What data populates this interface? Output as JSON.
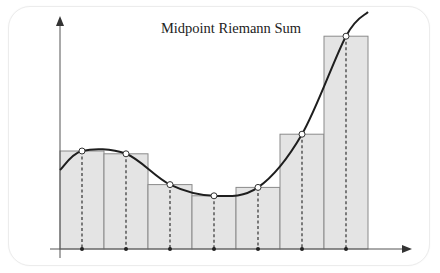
{
  "title": "Midpoint Riemann Sum",
  "colors": {
    "bar_fill": "#e4e4e4",
    "bar_stroke": "#8a8a8a",
    "curve": "#1e1e1e",
    "axis": "#555555",
    "dashed": "#333333",
    "midpoint_fill": "#ffffff"
  },
  "chart_data": {
    "type": "bar",
    "title": "Midpoint Riemann Sum",
    "xlabel": "",
    "ylabel": "",
    "axes": {
      "x_arrow": true,
      "y_arrow": true,
      "tick_labels": false,
      "grid": false
    },
    "intervals": 7,
    "categories": [
      "1",
      "2",
      "3",
      "4",
      "5",
      "6",
      "7"
    ],
    "values": [
      3.5,
      3.4,
      2.3,
      1.9,
      2.2,
      4.1,
      7.6
    ],
    "midpoints_on_curve": true,
    "curve": "smooth cubic-like function f(x) overlaid; each rectangle height = f(midpoint)"
  }
}
